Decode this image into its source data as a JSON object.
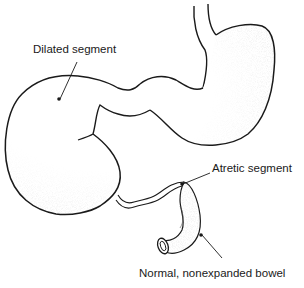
{
  "diagram": {
    "type": "anatomical-illustration",
    "colors": {
      "outline": "#1a1a1a",
      "stipple": "#9a9a9a",
      "background": "#ffffff"
    },
    "labels": [
      {
        "id": "dilated",
        "text": "Dilated segment",
        "x": 33,
        "y": 49
      },
      {
        "id": "atretic",
        "text": "Atretic segment",
        "x": 212,
        "y": 167
      },
      {
        "id": "normal",
        "text": "Normal, nonexpanded bowel",
        "x": 139,
        "y": 272
      }
    ],
    "leaders": [
      {
        "id": "dilated-leader",
        "x1": 77,
        "y1": 62,
        "x2": 60,
        "y2": 99
      },
      {
        "id": "atretic-leader",
        "x1": 210,
        "y1": 173,
        "x2": 183,
        "y2": 184
      },
      {
        "id": "normal-leader",
        "x1": 222,
        "y1": 258,
        "x2": 202,
        "y2": 235
      }
    ],
    "points": [
      {
        "id": "dilated-point",
        "x": 59,
        "y": 99
      },
      {
        "id": "atretic-point",
        "x": 182,
        "y": 184
      },
      {
        "id": "normal-point",
        "x": 201,
        "y": 235
      }
    ]
  }
}
